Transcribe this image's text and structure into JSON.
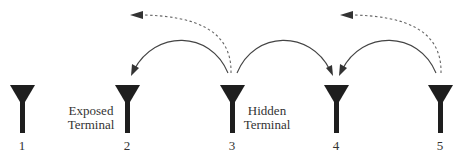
{
  "diagram": {
    "type": "wireless-network-hidden-exposed-terminal",
    "colors": {
      "antenna": "#1e1e1e",
      "solid_arrow": "#444444",
      "dashed_arrow": "#666666",
      "text": "#333333",
      "background": "#ffffff"
    },
    "nodes": [
      {
        "id": 1,
        "label": "1",
        "x": 22
      },
      {
        "id": 2,
        "label": "2",
        "x": 127
      },
      {
        "id": 3,
        "label": "3",
        "x": 232
      },
      {
        "id": 4,
        "label": "4",
        "x": 336
      },
      {
        "id": 5,
        "label": "5",
        "x": 440
      }
    ],
    "annotations": [
      {
        "id": "exposed",
        "line1": "Exposed",
        "line2": "Terminal",
        "near_node": 2
      },
      {
        "id": "hidden",
        "line1": "Hidden",
        "line2": "Terminal",
        "near_node": 3
      }
    ],
    "edges": [
      {
        "from": 3,
        "to": 2,
        "style": "solid"
      },
      {
        "from": 3,
        "to": 4,
        "style": "solid"
      },
      {
        "from": 5,
        "to": 4,
        "style": "solid"
      },
      {
        "from": 3,
        "to": "off-left",
        "style": "dashed"
      },
      {
        "from": 5,
        "to": "off-left",
        "style": "dashed"
      }
    ]
  }
}
